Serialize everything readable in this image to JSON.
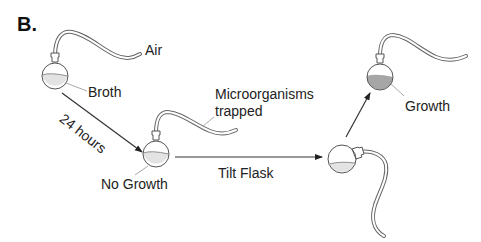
{
  "panel_label": "B.",
  "labels": {
    "air": "Air",
    "broth": "Broth",
    "hours": "24 hours",
    "no_growth": "No Growth",
    "microorganisms_line1": "Microorganisms",
    "microorganisms_line2": "trapped",
    "tilt": "Tilt Flask",
    "growth": "Growth"
  },
  "colors": {
    "line": "#333333",
    "tube": "#666666",
    "broth_fill": "#e3e3e3",
    "growth_fill": "#a6a6a6",
    "leader": "#aaaaaa"
  }
}
